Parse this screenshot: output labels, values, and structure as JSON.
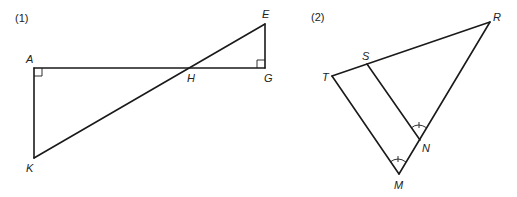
{
  "figures": [
    {
      "label": "(1)",
      "points": {
        "A": {
          "label": "A",
          "x": 34,
          "y": 68
        },
        "H": {
          "label": "H",
          "x": 190,
          "y": 68
        },
        "G": {
          "label": "G",
          "x": 265,
          "y": 68
        },
        "E": {
          "label": "E",
          "x": 265,
          "y": 24
        },
        "K": {
          "label": "K",
          "x": 34,
          "y": 158
        }
      },
      "segments": [
        "AG",
        "AK",
        "KE",
        "EG"
      ],
      "right_angles": [
        "A",
        "G"
      ]
    },
    {
      "label": "(2)",
      "points": {
        "R": {
          "label": "R",
          "x": 490,
          "y": 22
        },
        "S": {
          "label": "S",
          "x": 367,
          "y": 64
        },
        "T": {
          "label": "T",
          "x": 332,
          "y": 76
        },
        "N": {
          "label": "N",
          "x": 420,
          "y": 140
        },
        "M": {
          "label": "M",
          "x": 399,
          "y": 174
        }
      },
      "segments": [
        "TR",
        "TM",
        "MR",
        "SN"
      ],
      "congruent_angles": [
        "SNR",
        "TMN"
      ]
    }
  ]
}
